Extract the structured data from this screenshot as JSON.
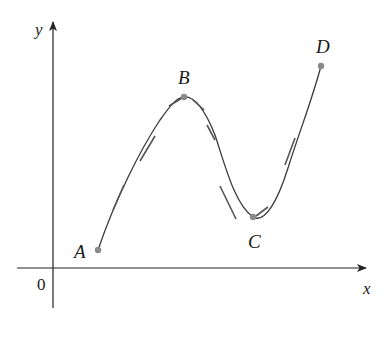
{
  "figure": {
    "axes": {
      "x_label": "x",
      "y_label": "y",
      "origin_label": "0",
      "axis_color": "#222222"
    },
    "curve": {
      "color": "#3a3a3a",
      "tangent_color": "#555555",
      "point_color": "#8a8a8a"
    },
    "points": [
      {
        "name": "A",
        "label": "A",
        "x": 98,
        "y": 250
      },
      {
        "name": "B",
        "label": "B",
        "x": 184,
        "y": 97
      },
      {
        "name": "C",
        "label": "C",
        "x": 253,
        "y": 217
      },
      {
        "name": "D",
        "label": "D",
        "x": 321,
        "y": 66
      }
    ]
  }
}
